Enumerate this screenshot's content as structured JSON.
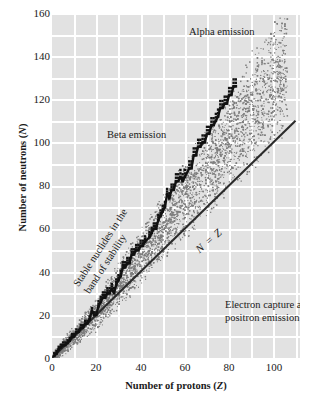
{
  "chart_data": {
    "type": "scatter",
    "title": "",
    "xlabel": "Number of protons (Z)",
    "ylabel": "Number of neutrons (N)",
    "xlim": [
      0,
      112
    ],
    "ylim": [
      0,
      160
    ],
    "xticks": [
      0,
      20,
      40,
      60,
      80,
      100
    ],
    "yticks": [
      0,
      20,
      40,
      60,
      80,
      100,
      120,
      140,
      160
    ],
    "grid": true,
    "legend": "none",
    "annotations": [
      {
        "id": "alpha",
        "text": "Alpha emission",
        "x": 62,
        "y": 157
      },
      {
        "id": "beta",
        "text": "Beta emission",
        "x": 20,
        "y": 110
      },
      {
        "id": "electron_capture",
        "text": "Electron capture and",
        "x": 73,
        "y": 33
      },
      {
        "id": "positron",
        "text": "positron emission",
        "x": 73,
        "y": 27
      },
      {
        "id": "nz",
        "text": "N = Z",
        "x": 56,
        "y": 50
      },
      {
        "id": "band1",
        "text": "Stable nuclides in the",
        "x": 22,
        "y": 60
      },
      {
        "id": "band2",
        "text": "band of stability",
        "x": 22,
        "y": 55
      }
    ],
    "series": [
      {
        "name": "N = Z reference line",
        "type": "line",
        "color": "#2b2b2b",
        "x": [
          0,
          110
        ],
        "y": [
          0,
          110
        ]
      },
      {
        "name": "Stable nuclides (band of stability)",
        "type": "scatter",
        "color": "#111111",
        "points_z": [
          1,
          2,
          3,
          4,
          5,
          6,
          7,
          8,
          9,
          10,
          11,
          12,
          13,
          14,
          15,
          16,
          17,
          18,
          19,
          20,
          21,
          22,
          23,
          24,
          25,
          26,
          27,
          28,
          29,
          30,
          31,
          32,
          33,
          34,
          35,
          36,
          37,
          38,
          39,
          40,
          41,
          42,
          44,
          45,
          46,
          47,
          48,
          49,
          50,
          51,
          52,
          53,
          54,
          55,
          56,
          57,
          58,
          59,
          60,
          62,
          63,
          64,
          65,
          66,
          67,
          68,
          69,
          70,
          71,
          72,
          73,
          74,
          75,
          76,
          77,
          78,
          79,
          80,
          81,
          82,
          83
        ],
        "points_n": [
          1,
          2,
          4,
          5,
          6,
          6,
          7,
          8,
          10,
          10,
          12,
          12,
          14,
          14,
          16,
          16,
          18,
          22,
          20,
          20,
          24,
          26,
          28,
          28,
          30,
          30,
          32,
          30,
          34,
          36,
          38,
          42,
          42,
          44,
          44,
          48,
          48,
          50,
          50,
          52,
          52,
          54,
          56,
          58,
          60,
          60,
          64,
          66,
          68,
          70,
          76,
          74,
          78,
          78,
          82,
          82,
          84,
          82,
          84,
          88,
          88,
          94,
          94,
          98,
          98,
          100,
          100,
          104,
          104,
          108,
          108,
          110,
          112,
          116,
          116,
          118,
          118,
          122,
          122,
          126,
          126
        ]
      },
      {
        "name": "Unstable nuclide envelope (stipple)",
        "type": "density",
        "color": "#8a8a8a",
        "description": "Stippled cloud of radioactive nuclides surrounding the band of stability, widening toward high Z and extending to N = 160 near Z = 105"
      }
    ]
  }
}
